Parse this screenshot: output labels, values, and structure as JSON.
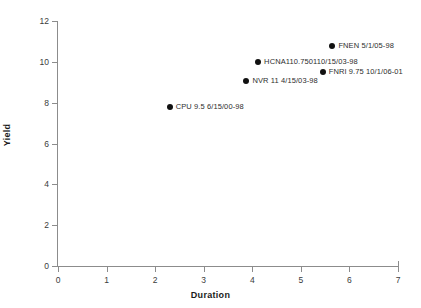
{
  "chart_data": {
    "type": "scatter",
    "title": "",
    "xlabel": "Duration",
    "ylabel": "Yield",
    "xlim": [
      0,
      7
    ],
    "ylim": [
      0,
      12
    ],
    "xticks": [
      "0",
      "1",
      "2",
      "3",
      "4",
      "5",
      "6",
      "7"
    ],
    "yticks": [
      "0",
      "2",
      "4",
      "6",
      "8",
      "10",
      "12"
    ],
    "grid": false,
    "legend": "none",
    "marker_color": "#111111",
    "axis_color": "#8c8c8c",
    "background": "#ffffff",
    "points": [
      {
        "label": "CPU 9.5 6/15/00-98",
        "x": 2.3,
        "y": 7.8
      },
      {
        "label": "NVR 11 4/15/03-98",
        "x": 3.88,
        "y": 9.05
      },
      {
        "label": "HCNA110.750110/15/03-98",
        "x": 4.12,
        "y": 10.0
      },
      {
        "label": "FNRI 9.75 10/1/06-01",
        "x": 5.45,
        "y": 9.5
      },
      {
        "label": "FNEN 5/1/05-98",
        "x": 5.65,
        "y": 10.8
      }
    ]
  }
}
